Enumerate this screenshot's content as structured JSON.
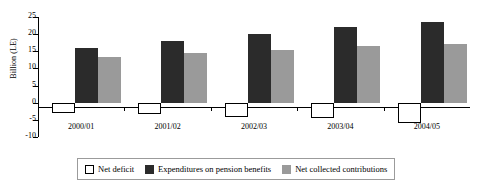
{
  "chart_data": {
    "type": "bar",
    "title": "",
    "xlabel": "",
    "ylabel": "Billion (LE)",
    "categories": [
      "2000/01",
      "2001/02",
      "2002/03",
      "2003/04",
      "2004/05"
    ],
    "ylim": [
      -10,
      25
    ],
    "yticks": [
      25,
      20,
      15,
      10,
      5,
      0,
      -5,
      -10
    ],
    "ytick_labels": [
      "25",
      "20",
      "15",
      "10",
      "5",
      "0",
      "-5",
      "-10"
    ],
    "grid": false,
    "legend_position": "bottom",
    "series": [
      {
        "name": "Net deficit",
        "color": "#ffffff",
        "values": [
          -3.0,
          -3.3,
          -4.2,
          -4.6,
          -6.0
        ]
      },
      {
        "name": "Expenditures on pension benefits",
        "color": "#2b2b2b",
        "values": [
          16.0,
          18.0,
          20.0,
          22.0,
          23.5
        ]
      },
      {
        "name": "Net collected contributions",
        "color": "#9a9a9a",
        "values": [
          13.4,
          14.5,
          15.4,
          16.6,
          17.2
        ]
      }
    ]
  }
}
